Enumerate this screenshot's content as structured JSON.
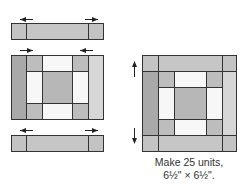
{
  "diagram": {
    "type": "quilt-block-assembly",
    "colors": {
      "outline": "#333333",
      "dark_strip": "#a9a9a9",
      "medium_square": "#bdbdbd",
      "light_strip": "#d6d6d6",
      "strip_middle": "#c6c6c6",
      "strip_end": "#c3c3c3",
      "white_piece": "#f7f7f7",
      "center_square": "#b7b7b7",
      "arrow": "#222222"
    },
    "left_assembly": {
      "top_row": {
        "arrows": [
          "left",
          "right"
        ]
      },
      "middle_block": {
        "arrows": [
          "right",
          "left"
        ]
      },
      "bottom_row": {
        "arrows": [
          "left",
          "right"
        ]
      }
    },
    "right_assembly": {
      "arrows": [
        "up",
        "down"
      ]
    },
    "caption": {
      "line1": "Make 25 units,",
      "line2": "6½\" × 6½\"."
    }
  }
}
